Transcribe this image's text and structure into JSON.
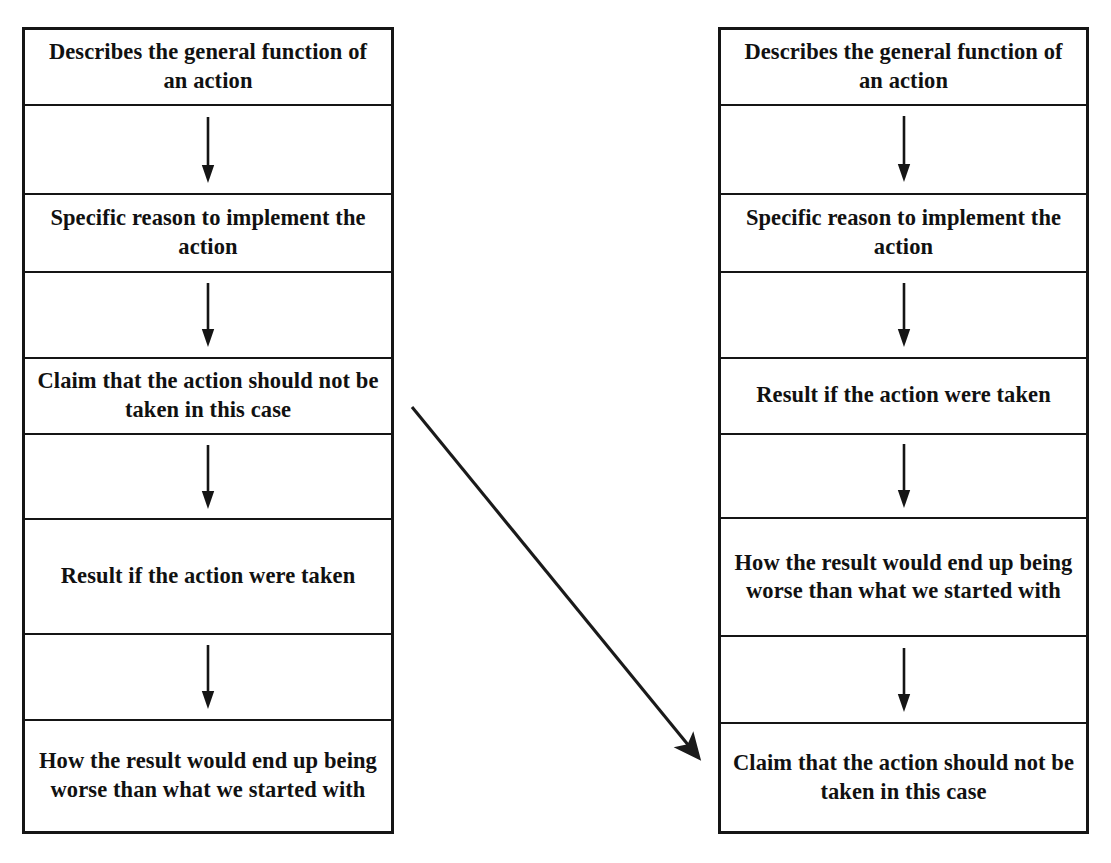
{
  "figure": {
    "type": "flowchart-comparison",
    "orientation": "two-column",
    "background_color": "#ffffff",
    "line_color": "#151515",
    "text_color": "#111111",
    "clipped_top_text": ""
  },
  "left_column": {
    "name": "left-flowchart",
    "cells": [
      {
        "kind": "text",
        "label": "Describes the general function of an action"
      },
      {
        "kind": "arrow",
        "label": "down-arrow"
      },
      {
        "kind": "text",
        "label": "Specific reason to implement the action"
      },
      {
        "kind": "arrow",
        "label": "down-arrow"
      },
      {
        "kind": "text",
        "label": "Claim that the action should not be taken in this case"
      },
      {
        "kind": "arrow",
        "label": "down-arrow"
      },
      {
        "kind": "text",
        "label": "Result if the action were taken"
      },
      {
        "kind": "arrow",
        "label": "down-arrow"
      },
      {
        "kind": "text",
        "label": "How the result would end up being worse than what we started with"
      }
    ]
  },
  "right_column": {
    "name": "right-flowchart",
    "cells": [
      {
        "kind": "text",
        "label": "Describes the general function of an action"
      },
      {
        "kind": "arrow",
        "label": "down-arrow"
      },
      {
        "kind": "text",
        "label": "Specific reason to implement the action"
      },
      {
        "kind": "arrow",
        "label": "down-arrow"
      },
      {
        "kind": "text",
        "label": "Result if the action were taken"
      },
      {
        "kind": "arrow",
        "label": "down-arrow"
      },
      {
        "kind": "text",
        "label": "How the result would end up being worse than what we started with"
      },
      {
        "kind": "arrow",
        "label": "down-arrow"
      },
      {
        "kind": "text",
        "label": "Claim that the action should not be taken in this case"
      }
    ]
  },
  "connector": {
    "name": "diagonal-move-arrow",
    "from": "left Claim that the action should not be taken in this case",
    "to": "right Claim that the action should not be taken in this case",
    "start": {
      "x": 412,
      "y": 407
    },
    "end": {
      "x": 703,
      "y": 762
    },
    "color": "#1a1a1a"
  }
}
